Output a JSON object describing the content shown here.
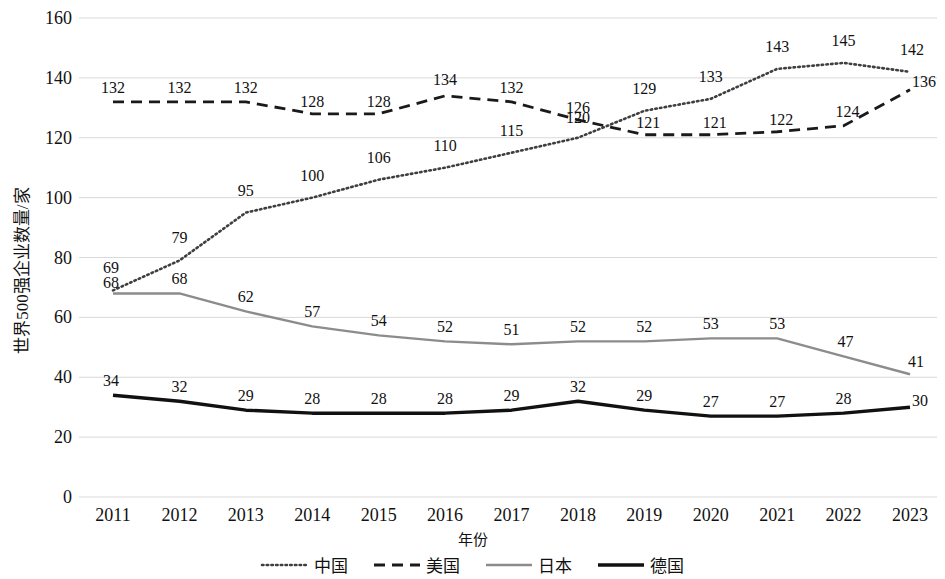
{
  "chart_data": {
    "type": "line",
    "title": "",
    "xlabel": "年份",
    "ylabel": "世界500强企业数量/家",
    "categories": [
      "2011",
      "2012",
      "2013",
      "2014",
      "2015",
      "2016",
      "2017",
      "2018",
      "2019",
      "2020",
      "2021",
      "2022",
      "2023"
    ],
    "ylim": [
      0,
      160
    ],
    "yticks": [
      0,
      20,
      40,
      60,
      80,
      100,
      120,
      140,
      160
    ],
    "grid": true,
    "legend_position": "bottom",
    "series": [
      {
        "name": "中国",
        "style": "dotted",
        "color": "#3f3f3f",
        "values": [
          69,
          79,
          95,
          100,
          106,
          110,
          115,
          120,
          129,
          133,
          143,
          145,
          142
        ]
      },
      {
        "name": "美国",
        "style": "dashed",
        "color": "#1a1a1a",
        "values": [
          132,
          132,
          132,
          128,
          128,
          134,
          132,
          126,
          121,
          121,
          122,
          124,
          136
        ]
      },
      {
        "name": "日本",
        "style": "solid",
        "color": "#8c8c8c",
        "values": [
          68,
          68,
          62,
          57,
          54,
          52,
          51,
          52,
          52,
          53,
          53,
          47,
          41
        ]
      },
      {
        "name": "德国",
        "style": "solid-bold",
        "color": "#111111",
        "values": [
          34,
          32,
          29,
          28,
          28,
          28,
          29,
          32,
          29,
          27,
          27,
          28,
          30
        ]
      }
    ]
  },
  "yticklabels": [
    "160",
    "140",
    "120",
    "100",
    "80",
    "60",
    "40",
    "20",
    "0"
  ],
  "legend": {
    "items": [
      {
        "label": "中国",
        "swatch": "dotted-line-icon"
      },
      {
        "label": "美国",
        "swatch": "dashed-line-icon"
      },
      {
        "label": "日本",
        "swatch": "gray-solid-line-icon"
      },
      {
        "label": "德国",
        "swatch": "black-solid-line-icon"
      }
    ]
  }
}
